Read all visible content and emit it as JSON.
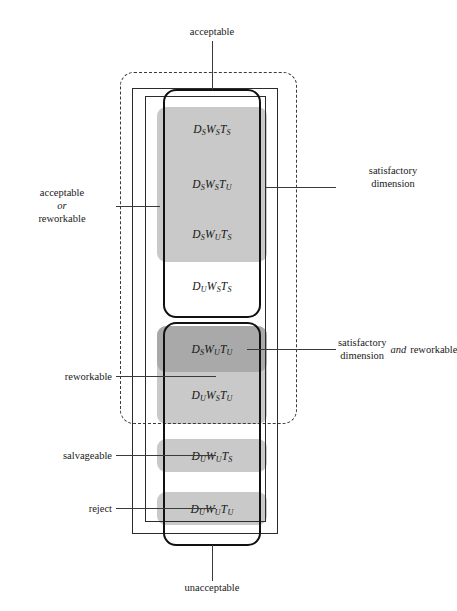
{
  "diagram": {
    "title_top": "acceptable",
    "title_bottom": "unacceptable",
    "cells": [
      {
        "id": "c1",
        "d": "D",
        "d_sub": "S",
        "w": "W",
        "w_sub": "S",
        "t": "T",
        "t_sub": "S",
        "text": "DSWSTS"
      },
      {
        "id": "c2",
        "d": "D",
        "d_sub": "S",
        "w": "W",
        "w_sub": "S",
        "t": "T",
        "t_sub": "U",
        "text": "DSWSTU"
      },
      {
        "id": "c3",
        "d": "D",
        "d_sub": "S",
        "w": "W",
        "w_sub": "U",
        "t": "T",
        "t_sub": "S",
        "text": "DSWUTS"
      },
      {
        "id": "c4",
        "d": "D",
        "d_sub": "U",
        "w": "W",
        "w_sub": "S",
        "t": "T",
        "t_sub": "S",
        "text": "DUWSTS"
      },
      {
        "id": "c5",
        "d": "D",
        "d_sub": "S",
        "w": "W",
        "w_sub": "U",
        "t": "T",
        "t_sub": "U",
        "text": "DSWUTU"
      },
      {
        "id": "c6",
        "d": "D",
        "d_sub": "U",
        "w": "W",
        "w_sub": "S",
        "t": "T",
        "t_sub": "U",
        "text": "DUWSTU"
      },
      {
        "id": "c7",
        "d": "D",
        "d_sub": "U",
        "w": "W",
        "w_sub": "U",
        "t": "T",
        "t_sub": "S",
        "text": "DUWUTS"
      },
      {
        "id": "c8",
        "d": "D",
        "d_sub": "U",
        "w": "W",
        "w_sub": "U",
        "t": "T",
        "t_sub": "U",
        "text": "DUWUTU"
      }
    ],
    "left_labels": {
      "acceptable_or_reworkable_line1": "acceptable",
      "acceptable_or_reworkable_line2": "or",
      "acceptable_or_reworkable_line3": "reworkable",
      "reworkable": "reworkable",
      "salvageable": "salvageable",
      "reject": "reject"
    },
    "right_labels": {
      "satisfactory_dimension_line1": "satisfactory",
      "satisfactory_dimension_line2": "dimension",
      "satisfactory_and_reworkable_line1": "satisfactory",
      "satisfactory_and_reworkable_line2": "dimension",
      "satisfactory_and_reworkable_suffix_italic": "and",
      "satisfactory_and_reworkable_suffix": "reworkable"
    },
    "colors": {
      "shade": "#c9c9c9",
      "shade_overlap": "#9f9f9f",
      "outline_thick": "#111111",
      "outline_thin": "#2b2b2b",
      "outline_dashed": "#3a3a3a",
      "background": "#ffffff",
      "text": "#1a1a1a"
    }
  }
}
